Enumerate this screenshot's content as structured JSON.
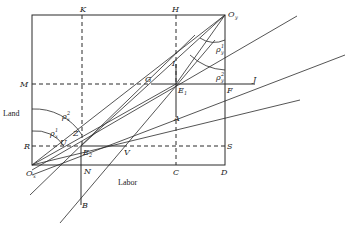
{
  "diagram": {
    "type": "edgeworth-box",
    "axis_labels": {
      "vertical": "Land",
      "horizontal": "Labor"
    },
    "points": [
      {
        "id": "Ox",
        "label": "O",
        "sub": "x",
        "x": 32,
        "y": 165
      },
      {
        "id": "Oy",
        "label": "O",
        "sub": "y",
        "x": 225,
        "y": 15
      },
      {
        "id": "K",
        "label": "K",
        "sub": "",
        "x": 82,
        "y": 15
      },
      {
        "id": "H",
        "label": "H",
        "sub": "",
        "x": 176,
        "y": 15
      },
      {
        "id": "M",
        "label": "M",
        "sub": "",
        "x": 32,
        "y": 84
      },
      {
        "id": "G",
        "label": "G",
        "sub": "",
        "x": 152,
        "y": 84
      },
      {
        "id": "I",
        "label": "I",
        "sub": "",
        "x": 176,
        "y": 64
      },
      {
        "id": "E1",
        "label": "E",
        "sub": "1",
        "x": 176,
        "y": 84
      },
      {
        "id": "F",
        "label": "F",
        "sub": "",
        "x": 225,
        "y": 84
      },
      {
        "id": "J",
        "label": "J",
        "sub": "",
        "x": 255,
        "y": 84
      },
      {
        "id": "A",
        "label": "A",
        "sub": "",
        "x": 176,
        "y": 113
      },
      {
        "id": "R",
        "label": "R",
        "sub": "",
        "x": 32,
        "y": 146
      },
      {
        "id": "Z",
        "label": "Z",
        "sub": "",
        "x": 80,
        "y": 133
      },
      {
        "id": "U",
        "label": "U",
        "sub": "",
        "x": 66,
        "y": 146
      },
      {
        "id": "E2",
        "label": "E",
        "sub": "2",
        "x": 81,
        "y": 146
      },
      {
        "id": "V",
        "label": "V",
        "sub": "",
        "x": 123,
        "y": 146
      },
      {
        "id": "S",
        "label": "S",
        "sub": "",
        "x": 225,
        "y": 146
      },
      {
        "id": "N",
        "label": "N",
        "sub": "",
        "x": 81,
        "y": 165
      },
      {
        "id": "C",
        "label": "C",
        "sub": "",
        "x": 176,
        "y": 165
      },
      {
        "id": "D",
        "label": "D",
        "sub": "",
        "x": 225,
        "y": 165
      },
      {
        "id": "B",
        "label": "B",
        "sub": "",
        "x": 81,
        "y": 203
      }
    ],
    "angle_labels": [
      {
        "id": "rho-x-2",
        "text": "ρ",
        "sub": "x",
        "sup": "2"
      },
      {
        "id": "rho-x-1",
        "text": "ρ",
        "sub": "x",
        "sup": "1"
      },
      {
        "id": "rho-y-2",
        "text": "ρ",
        "sub": "y",
        "sup": "2"
      },
      {
        "id": "rho-y-1",
        "text": "ρ",
        "sub": "y",
        "sup": "1"
      }
    ]
  }
}
